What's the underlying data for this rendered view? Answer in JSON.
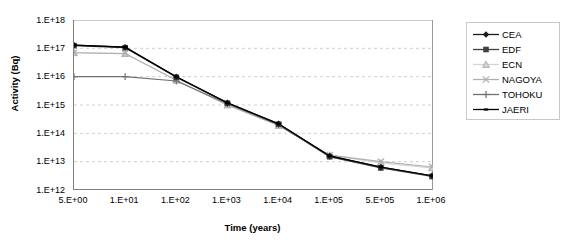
{
  "chart_data": {
    "type": "line",
    "title": "",
    "xlabel": "Time (years)",
    "ylabel": "Activity (Bq)",
    "x_scale": "category-log",
    "y_scale": "log",
    "ylim": [
      1000000000000.0,
      1e+18
    ],
    "grid": true,
    "legend_position": "right",
    "categories": [
      "5.E+00",
      "1.E+01",
      "1.E+02",
      "1.E+03",
      "1.E+04",
      "1.E+05",
      "5.E+05",
      "1.E+06"
    ],
    "y_ticks": [
      "1.E+12",
      "1.E+13",
      "1.E+14",
      "1.E+15",
      "1.E+16",
      "1.E+17",
      "1.E+18"
    ],
    "x_ticks": [
      "5.E+00",
      "1.E+01",
      "1.E+02",
      "1.E+03",
      "1.E+04",
      "1.E+05",
      "5.E+05",
      "1.E+06"
    ],
    "series": [
      {
        "name": "CEA",
        "marker": "diamond",
        "color": "#1a1a1a",
        "values": [
          1.3e+17,
          1.1e+17,
          1e+16,
          1200000000000000.0,
          220000000000000.0,
          16000000000000.0,
          6500000000000.0,
          3200000000000.0
        ]
      },
      {
        "name": "EDF",
        "marker": "square",
        "color": "#404040",
        "values": [
          1.25e+17,
          1.05e+17,
          9500000000000000.0,
          1150000000000000.0,
          210000000000000.0,
          15000000000000.0,
          6000000000000.0,
          3000000000000.0
        ]
      },
      {
        "name": "ECN",
        "marker": "triangle",
        "color": "#d4d4d4",
        "values": [
          7e+16,
          6.5e+16,
          7500000000000000.0,
          1000000000000000.0,
          190000000000000.0,
          17000000000000.0,
          9000000000000.0,
          6000000000000.0
        ]
      },
      {
        "name": "NAGOYA",
        "marker": "cross-x",
        "color": "#b0b0b0",
        "values": [
          7e+16,
          6.5e+16,
          7500000000000000.0,
          1000000000000000.0,
          190000000000000.0,
          17000000000000.0,
          10000000000000.0,
          6500000000000.0
        ]
      },
      {
        "name": "TOHOKU",
        "marker": "plus",
        "color": "#707070",
        "values": [
          1e+16,
          1e+16,
          7000000000000000.0,
          1100000000000000.0,
          200000000000000.0,
          15000000000000.0,
          6200000000000.0,
          3100000000000.0
        ]
      },
      {
        "name": "JAERI",
        "marker": "dash",
        "color": "#000000",
        "values": [
          1.3e+17,
          1.1e+17,
          1e+16,
          1200000000000000.0,
          220000000000000.0,
          16000000000000.0,
          6500000000000.0,
          3200000000000.0
        ]
      }
    ]
  }
}
